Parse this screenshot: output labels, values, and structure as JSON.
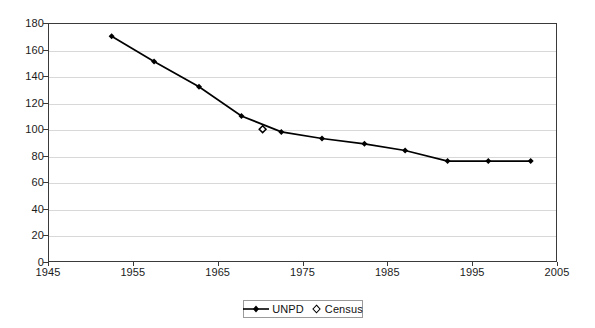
{
  "chart_data": {
    "type": "line",
    "title": "",
    "subtitle": "",
    "xlabel": "",
    "ylabel": "",
    "xlim": [
      1945,
      2005
    ],
    "ylim": [
      0,
      180
    ],
    "xticks": [
      1945,
      1955,
      1965,
      1975,
      1985,
      1995,
      2005
    ],
    "yticks": [
      0,
      20,
      40,
      60,
      80,
      100,
      120,
      140,
      160,
      180
    ],
    "grid": "horizontal",
    "legend_position": "bottom-center",
    "series": [
      {
        "name": "UNPD",
        "marker": "filled-diamond",
        "line": "solid",
        "color": "#000000",
        "x": [
          1952.5,
          1957.5,
          1962.8,
          1967.8,
          1972.5,
          1977.3,
          1982.3,
          1987.1,
          1992.1,
          1996.9,
          2001.9
        ],
        "values": [
          170,
          151,
          132,
          110,
          98,
          93,
          89,
          84,
          76,
          76,
          76
        ]
      },
      {
        "name": "Census",
        "marker": "open-diamond",
        "line": "none",
        "color": "#000000",
        "x": [
          1970.3
        ],
        "values": [
          100
        ]
      }
    ]
  },
  "axes": {
    "y_tick_labels": [
      "180",
      "160",
      "140",
      "120",
      "100",
      "80",
      "60",
      "40",
      "20",
      "0"
    ],
    "x_tick_labels": [
      "1945",
      "1955",
      "1965",
      "1975",
      "1985",
      "1995",
      "2005"
    ]
  },
  "legend": {
    "items": [
      {
        "label": "UNPD",
        "swatch": "line-with-diamond-marker"
      },
      {
        "label": "Census",
        "swatch": "open-diamond-marker"
      }
    ]
  },
  "colors": {
    "series_line": "#000000",
    "axis": "#3a3a3a",
    "gridline": "#d8d8d8",
    "background": "#ffffff",
    "text": "#1b1b1b"
  }
}
